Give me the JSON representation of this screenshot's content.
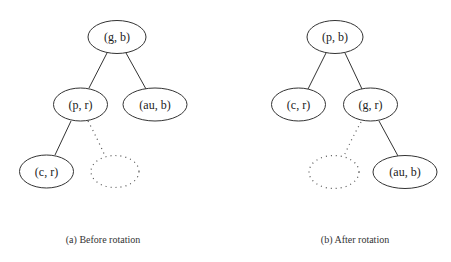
{
  "diagrams": [
    {
      "caption": "(a) Before rotation",
      "nodes": {
        "root": "(g, b)",
        "left": "(p, r)",
        "right": "(au, b)",
        "left_left": "(c, r)",
        "left_right_placeholder": ""
      }
    },
    {
      "caption": "(b) After rotation",
      "nodes": {
        "root": "(p, b)",
        "left": "(c, r)",
        "right": "(g, r)",
        "right_left_placeholder": "",
        "right_right": "(au, b)"
      }
    }
  ],
  "colors": {
    "stroke": "#333333",
    "dotted": "#555555",
    "text": "#222222"
  }
}
